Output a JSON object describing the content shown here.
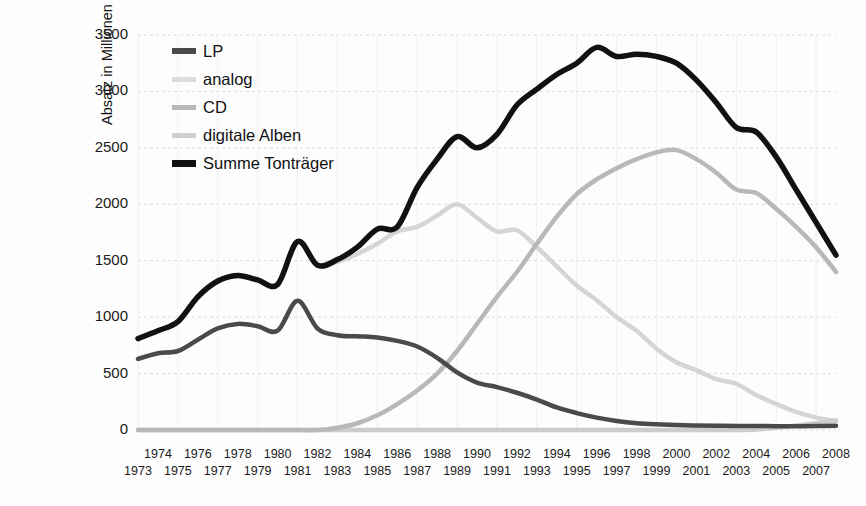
{
  "chart_data": {
    "type": "line",
    "title": "",
    "subtitle": "",
    "xlabel": "",
    "ylabel": "Absatz in Millionen Stück",
    "xlim": [
      1973,
      2008
    ],
    "ylim": [
      0,
      3500
    ],
    "ytick_labels": [
      "0",
      "500",
      "1000",
      "1500",
      "2000",
      "2500",
      "3000",
      "3500"
    ],
    "ytick_values": [
      0,
      500,
      1000,
      1500,
      2000,
      2500,
      3000,
      3500
    ],
    "grid": true,
    "grid_axis": "y",
    "legend_position": "upper-left-inside",
    "x": [
      1973,
      1974,
      1975,
      1976,
      1977,
      1978,
      1979,
      1980,
      1981,
      1982,
      1983,
      1984,
      1985,
      1986,
      1987,
      1988,
      1989,
      1990,
      1991,
      1992,
      1993,
      1994,
      1995,
      1996,
      1997,
      1998,
      1999,
      2000,
      2001,
      2002,
      2003,
      2004,
      2005,
      2006,
      2007,
      2008
    ],
    "xtick_labels_top": [
      "1974",
      "1976",
      "1978",
      "1980",
      "1982",
      "1984",
      "1986",
      "1988",
      "1990",
      "1992",
      "1994",
      "1996",
      "1998",
      "2000",
      "2002",
      "2004",
      "2006",
      "2008"
    ],
    "xtick_labels_bottom": [
      "1973",
      "1975",
      "1977",
      "1979",
      "1981",
      "1983",
      "1985",
      "1987",
      "1989",
      "1991",
      "1993",
      "1995",
      "1997",
      "1999",
      "2001",
      "2003",
      "2005",
      "2007"
    ],
    "series": [
      {
        "name": "LP",
        "color": "#4a4a4a",
        "width": 4.5,
        "values": [
          630,
          680,
          700,
          800,
          900,
          940,
          920,
          880,
          1145,
          900,
          840,
          830,
          820,
          790,
          740,
          640,
          510,
          420,
          380,
          330,
          270,
          200,
          150,
          110,
          80,
          60,
          50,
          45,
          40,
          38,
          36,
          35,
          34,
          34,
          35,
          38
        ]
      },
      {
        "name": "analog",
        "color": "#d5d5d5",
        "width": 4.5,
        "values": [
          810,
          880,
          960,
          1180,
          1320,
          1370,
          1330,
          1290,
          1670,
          1460,
          1490,
          1560,
          1650,
          1760,
          1800,
          1900,
          2000,
          1880,
          1760,
          1770,
          1620,
          1450,
          1280,
          1150,
          1000,
          880,
          720,
          600,
          530,
          450,
          410,
          310,
          230,
          160,
          110,
          80
        ]
      },
      {
        "name": "CD",
        "color": "#b8b8b8",
        "width": 4.5,
        "values": [
          0,
          0,
          0,
          0,
          0,
          0,
          0,
          0,
          0,
          0,
          20,
          60,
          130,
          230,
          350,
          500,
          700,
          940,
          1180,
          1400,
          1650,
          1890,
          2090,
          2220,
          2320,
          2400,
          2460,
          2480,
          2400,
          2280,
          2130,
          2100,
          1960,
          1800,
          1620,
          1400
        ]
      },
      {
        "name": "digitale Alben",
        "color": "#cccccc",
        "width": 4.5,
        "values": [
          0,
          0,
          0,
          0,
          0,
          0,
          0,
          0,
          0,
          0,
          0,
          0,
          0,
          0,
          0,
          0,
          0,
          0,
          0,
          0,
          0,
          0,
          0,
          0,
          0,
          0,
          0,
          0,
          0,
          0,
          0,
          5,
          20,
          40,
          60,
          85
        ]
      },
      {
        "name": "Summe Tonträger",
        "color": "#111111",
        "width": 5.5,
        "values": [
          810,
          880,
          960,
          1180,
          1320,
          1370,
          1330,
          1290,
          1670,
          1460,
          1510,
          1620,
          1780,
          1800,
          2150,
          2400,
          2600,
          2500,
          2620,
          2880,
          3020,
          3150,
          3250,
          3390,
          3310,
          3330,
          3310,
          3250,
          3100,
          2900,
          2680,
          2640,
          2420,
          2130,
          1840,
          1550
        ]
      }
    ]
  },
  "legend": {
    "items": [
      {
        "label": "LP",
        "color": "#4a4a4a",
        "swatch_thickness": 6
      },
      {
        "label": "analog",
        "color": "#dcdcdc",
        "swatch_thickness": 5
      },
      {
        "label": "CD",
        "color": "#b8b8b8",
        "swatch_thickness": 5
      },
      {
        "label": "digitale Alben",
        "color": "#cfcfcf",
        "swatch_thickness": 5
      },
      {
        "label": "Summe Tonträger",
        "color": "#111111",
        "swatch_thickness": 7
      }
    ]
  },
  "axes": {
    "y_title": "Absatz in Millionen Stück"
  }
}
